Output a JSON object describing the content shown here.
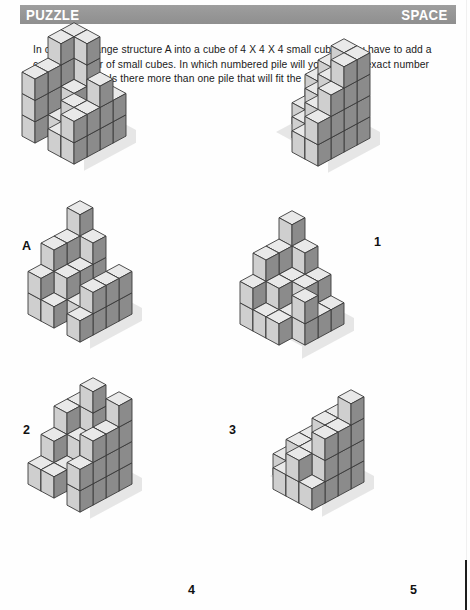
{
  "header": {
    "title_left": "PUZZLE",
    "title_right": "SPACE",
    "bar_color": "#979797",
    "text_color": "#ffffff"
  },
  "intro": {
    "text": "In order to change structure A into a cube of 4 X 4 X 4 small cubes, you have to add a certain number of small cubes. In which numbered pile will you find the exact number of small cubes? Is there more than one pile that will fit the purpose?"
  },
  "cube_style": {
    "top_face": "#e9e9e9",
    "left_face": "#cfcfcf",
    "right_face": "#8b8b8b",
    "edge": "#3a3a3a",
    "shadow": "#e2e2e2"
  },
  "figures": [
    {
      "id": "figure-a",
      "label": "A",
      "label_x": 22,
      "label_y": 240,
      "origin_x": 18,
      "origin_y": 98,
      "cube": 26,
      "voxels": [
        [
          0,
          0,
          0
        ],
        [
          1,
          0,
          0
        ],
        [
          2,
          0,
          0
        ],
        [
          3,
          0,
          0
        ],
        [
          0,
          1,
          0
        ],
        [
          1,
          1,
          0
        ],
        [
          2,
          1,
          0
        ],
        [
          3,
          1,
          0
        ],
        [
          0,
          2,
          0
        ],
        [
          1,
          2,
          0
        ],
        [
          2,
          2,
          0
        ],
        [
          3,
          2,
          0
        ],
        [
          0,
          3,
          0
        ],
        [
          2,
          3,
          0
        ],
        [
          3,
          3,
          0
        ],
        [
          0,
          0,
          1
        ],
        [
          1,
          0,
          1
        ],
        [
          3,
          0,
          1
        ],
        [
          0,
          1,
          1
        ],
        [
          1,
          1,
          1
        ],
        [
          3,
          1,
          1
        ],
        [
          0,
          2,
          1
        ],
        [
          2,
          2,
          1
        ],
        [
          3,
          2,
          1
        ],
        [
          0,
          3,
          1
        ],
        [
          3,
          3,
          1
        ],
        [
          0,
          0,
          2
        ],
        [
          1,
          0,
          2
        ],
        [
          0,
          1,
          2
        ],
        [
          3,
          1,
          2
        ],
        [
          0,
          2,
          2
        ],
        [
          0,
          3,
          2
        ],
        [
          0,
          0,
          3
        ],
        [
          1,
          0,
          3
        ],
        [
          0,
          1,
          3
        ]
      ]
    },
    {
      "id": "figure-1",
      "label": "1",
      "label_x": 374,
      "label_y": 236,
      "origin_x": 262,
      "origin_y": 100,
      "cube": 26,
      "voxels": [
        [
          0,
          0,
          0
        ],
        [
          1,
          0,
          0
        ],
        [
          2,
          0,
          0
        ],
        [
          3,
          0,
          0
        ],
        [
          0,
          1,
          0
        ],
        [
          1,
          1,
          0
        ],
        [
          2,
          1,
          0
        ],
        [
          3,
          1,
          0
        ],
        [
          1,
          2,
          0
        ],
        [
          2,
          2,
          0
        ],
        [
          3,
          2,
          0
        ],
        [
          2,
          3,
          0
        ],
        [
          3,
          3,
          0
        ],
        [
          0,
          0,
          1
        ],
        [
          1,
          0,
          1
        ],
        [
          2,
          0,
          1
        ],
        [
          3,
          0,
          1
        ],
        [
          1,
          1,
          1
        ],
        [
          2,
          1,
          1
        ],
        [
          3,
          1,
          1
        ],
        [
          2,
          2,
          1
        ],
        [
          3,
          2,
          1
        ],
        [
          3,
          3,
          1
        ],
        [
          1,
          0,
          2
        ],
        [
          2,
          0,
          2
        ],
        [
          3,
          0,
          2
        ],
        [
          2,
          1,
          2
        ],
        [
          3,
          1,
          2
        ],
        [
          3,
          2,
          2
        ],
        [
          2,
          0,
          3
        ],
        [
          3,
          0,
          3
        ],
        [
          3,
          1,
          3
        ]
      ]
    },
    {
      "id": "figure-2",
      "label": "2",
      "label_x": 23,
      "label_y": 424,
      "origin_x": 24,
      "origin_y": 276,
      "cube": 26,
      "voxels": [
        [
          0,
          0,
          0
        ],
        [
          1,
          0,
          0
        ],
        [
          2,
          0,
          0
        ],
        [
          3,
          0,
          0
        ],
        [
          0,
          1,
          0
        ],
        [
          1,
          1,
          0
        ],
        [
          2,
          1,
          0
        ],
        [
          3,
          1,
          0
        ],
        [
          0,
          2,
          0
        ],
        [
          1,
          2,
          0
        ],
        [
          2,
          2,
          0
        ],
        [
          3,
          2,
          0
        ],
        [
          0,
          3,
          0
        ],
        [
          1,
          3,
          0
        ],
        [
          3,
          3,
          0
        ],
        [
          0,
          0,
          1
        ],
        [
          1,
          0,
          1
        ],
        [
          3,
          0,
          1
        ],
        [
          0,
          1,
          1
        ],
        [
          1,
          1,
          1
        ],
        [
          3,
          1,
          1
        ],
        [
          0,
          2,
          1
        ],
        [
          1,
          2,
          1
        ],
        [
          3,
          2,
          1
        ],
        [
          0,
          3,
          1
        ],
        [
          0,
          0,
          2
        ],
        [
          1,
          0,
          2
        ],
        [
          0,
          1,
          2
        ],
        [
          0,
          2,
          2
        ],
        [
          0,
          0,
          3
        ]
      ]
    },
    {
      "id": "figure-3",
      "label": "3",
      "label_x": 229,
      "label_y": 424,
      "origin_x": 236,
      "origin_y": 286,
      "cube": 26,
      "voxels": [
        [
          0,
          0,
          0
        ],
        [
          1,
          0,
          0
        ],
        [
          2,
          0,
          0
        ],
        [
          3,
          0,
          0
        ],
        [
          0,
          1,
          0
        ],
        [
          1,
          1,
          0
        ],
        [
          2,
          1,
          0
        ],
        [
          3,
          1,
          0
        ],
        [
          0,
          2,
          0
        ],
        [
          1,
          2,
          0
        ],
        [
          2,
          2,
          0
        ],
        [
          3,
          2,
          0
        ],
        [
          0,
          3,
          0
        ],
        [
          1,
          3,
          0
        ],
        [
          2,
          3,
          0
        ],
        [
          0,
          0,
          1
        ],
        [
          1,
          0,
          1
        ],
        [
          2,
          0,
          1
        ],
        [
          0,
          1,
          1
        ],
        [
          1,
          1,
          1
        ],
        [
          2,
          1,
          1
        ],
        [
          0,
          2,
          1
        ],
        [
          1,
          2,
          1
        ],
        [
          3,
          2,
          1
        ],
        [
          0,
          3,
          1
        ],
        [
          0,
          0,
          2
        ],
        [
          1,
          0,
          2
        ],
        [
          0,
          1,
          2
        ],
        [
          0,
          2,
          2
        ],
        [
          0,
          0,
          3
        ]
      ]
    },
    {
      "id": "figure-4",
      "label": "4",
      "label_x": 188,
      "label_y": 584,
      "origin_x": 24,
      "origin_y": 446,
      "cube": 26,
      "voxels": [
        [
          0,
          0,
          0
        ],
        [
          1,
          0,
          0
        ],
        [
          2,
          0,
          0
        ],
        [
          3,
          0,
          0
        ],
        [
          0,
          1,
          0
        ],
        [
          1,
          1,
          0
        ],
        [
          2,
          1,
          0
        ],
        [
          3,
          1,
          0
        ],
        [
          0,
          2,
          0
        ],
        [
          1,
          2,
          0
        ],
        [
          2,
          2,
          0
        ],
        [
          3,
          2,
          0
        ],
        [
          0,
          3,
          0
        ],
        [
          1,
          3,
          0
        ],
        [
          3,
          3,
          0
        ],
        [
          0,
          0,
          1
        ],
        [
          1,
          0,
          1
        ],
        [
          3,
          0,
          1
        ],
        [
          0,
          1,
          1
        ],
        [
          1,
          1,
          1
        ],
        [
          3,
          1,
          1
        ],
        [
          0,
          2,
          1
        ],
        [
          3,
          2,
          1
        ],
        [
          3,
          3,
          1
        ],
        [
          0,
          0,
          2
        ],
        [
          1,
          0,
          2
        ],
        [
          3,
          0,
          2
        ],
        [
          0,
          1,
          2
        ],
        [
          3,
          1,
          2
        ],
        [
          3,
          2,
          2
        ],
        [
          1,
          0,
          3
        ],
        [
          3,
          0,
          3
        ]
      ]
    },
    {
      "id": "figure-5",
      "label": "5",
      "label_x": 410,
      "label_y": 584,
      "origin_x": 256,
      "origin_y": 444,
      "cube": 26,
      "voxels": [
        [
          0,
          0,
          0
        ],
        [
          1,
          0,
          0
        ],
        [
          2,
          0,
          0
        ],
        [
          3,
          0,
          0
        ],
        [
          0,
          1,
          0
        ],
        [
          1,
          1,
          0
        ],
        [
          2,
          1,
          0
        ],
        [
          3,
          1,
          0
        ],
        [
          0,
          2,
          0
        ],
        [
          1,
          2,
          0
        ],
        [
          2,
          2,
          0
        ],
        [
          3,
          2,
          0
        ],
        [
          1,
          3,
          0
        ],
        [
          2,
          3,
          0
        ],
        [
          3,
          3,
          0
        ],
        [
          1,
          0,
          1
        ],
        [
          2,
          0,
          1
        ],
        [
          3,
          0,
          1
        ],
        [
          1,
          1,
          1
        ],
        [
          2,
          1,
          1
        ],
        [
          3,
          1,
          1
        ],
        [
          1,
          2,
          1
        ],
        [
          2,
          2,
          1
        ],
        [
          3,
          2,
          1
        ],
        [
          2,
          3,
          1
        ],
        [
          2,
          0,
          2
        ],
        [
          3,
          0,
          2
        ],
        [
          2,
          1,
          2
        ],
        [
          3,
          1,
          2
        ],
        [
          3,
          2,
          2
        ],
        [
          3,
          0,
          3
        ]
      ]
    }
  ]
}
